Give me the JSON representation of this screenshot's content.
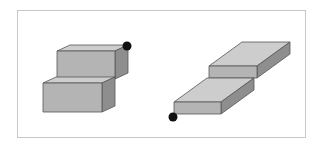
{
  "diagram": {
    "frame": {
      "x": 17,
      "y": 10,
      "w": 288,
      "h": 127,
      "stroke": "#c8c8c8"
    },
    "colors": {
      "front": "#b4b4b4",
      "top": "#cdcdcd",
      "side": "#8e8e8e",
      "edge": "#555555",
      "dot": "#111111"
    },
    "left_figure": {
      "name": "stepped-stack",
      "boxes": [
        {
          "name": "upper-box",
          "front": [
            [
              57,
              51
            ],
            [
              115,
              51
            ],
            [
              115,
              79
            ],
            [
              57,
              79
            ]
          ],
          "top": [
            [
              57,
              51
            ],
            [
              70,
              45
            ],
            [
              128,
              45
            ],
            [
              115,
              51
            ]
          ],
          "side": [
            [
              115,
              51
            ],
            [
              128,
              45
            ],
            [
              128,
              73
            ],
            [
              115,
              79
            ]
          ]
        },
        {
          "name": "lower-box",
          "front": [
            [
              43,
              83
            ],
            [
              102,
              83
            ],
            [
              102,
              112
            ],
            [
              43,
              112
            ]
          ],
          "top": [
            [
              43,
              83
            ],
            [
              56,
              77
            ],
            [
              115,
              77
            ],
            [
              102,
              83
            ]
          ],
          "side": [
            [
              102,
              83
            ],
            [
              115,
              77
            ],
            [
              115,
              106
            ],
            [
              102,
              112
            ]
          ]
        }
      ],
      "marker": {
        "cx": 127,
        "cy": 46,
        "r": 4.5
      }
    },
    "right_figure": {
      "name": "offset-slabs",
      "boxes": [
        {
          "name": "upper-slab",
          "front": [
            [
              209,
              66
            ],
            [
              257,
              66
            ],
            [
              257,
              78
            ],
            [
              209,
              78
            ]
          ],
          "top": [
            [
              209,
              66
            ],
            [
              242,
              42
            ],
            [
              290,
              42
            ],
            [
              257,
              66
            ]
          ],
          "side": [
            [
              257,
              66
            ],
            [
              290,
              42
            ],
            [
              290,
              54
            ],
            [
              257,
              78
            ]
          ]
        },
        {
          "name": "lower-slab",
          "front": [
            [
              174,
              102
            ],
            [
              221,
              102
            ],
            [
              221,
              114
            ],
            [
              174,
              114
            ]
          ],
          "top": [
            [
              174,
              102
            ],
            [
              207,
              78
            ],
            [
              254,
              78
            ],
            [
              221,
              102
            ]
          ],
          "side": [
            [
              221,
              102
            ],
            [
              254,
              78
            ],
            [
              254,
              90
            ],
            [
              221,
              114
            ]
          ]
        }
      ],
      "marker": {
        "cx": 173,
        "cy": 117,
        "r": 4.5
      }
    }
  }
}
